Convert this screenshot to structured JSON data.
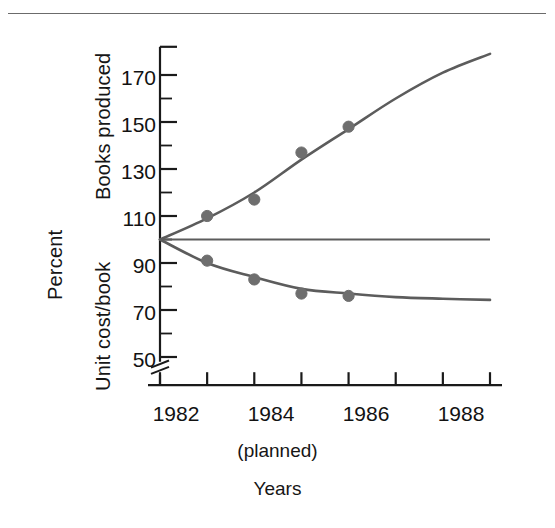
{
  "figure": {
    "top_rule": true,
    "marker_color": "#6e6e6e",
    "curve_color": "#5c5c5c",
    "axis_color": "#1a1a1a",
    "axis_break_note": "y-axis break below 50"
  },
  "axes": {
    "y_outer_label": "Percent",
    "y_inner_label_upper": "Books produced",
    "y_inner_label_lower": "Unit cost/book",
    "x_label": "Years",
    "x_note": "(planned)",
    "y_ticks": [
      "170",
      "150",
      "130",
      "110",
      "90",
      "70",
      "50"
    ],
    "x_ticks": [
      "1982",
      "1984",
      "1986",
      "1988"
    ]
  },
  "chart_data": {
    "type": "line",
    "title": "",
    "xlabel": "Years",
    "ylabel": "Percent",
    "xlim": [
      1982,
      1989
    ],
    "ylim": [
      45,
      182
    ],
    "grid": false,
    "legend": "none",
    "x_tick_values": [
      1982,
      1983,
      1984,
      1985,
      1986,
      1987,
      1988,
      1989
    ],
    "x_tick_labels": [
      "1982",
      "",
      "1984",
      "",
      "1986",
      "",
      "1988",
      ""
    ],
    "y_tick_values": [
      50,
      60,
      70,
      80,
      90,
      100,
      110,
      120,
      130,
      140,
      150,
      160,
      170
    ],
    "y_tick_labels": [
      "50",
      "",
      "70",
      "",
      "90",
      "",
      "110",
      "",
      "130",
      "",
      "150",
      "",
      "170"
    ],
    "annotations": [
      "(planned)"
    ],
    "series": [
      {
        "name": "Books produced",
        "kind": "fitted-curve-with-points",
        "x": [
          1982,
          1983,
          1984,
          1985,
          1986
        ],
        "values": [
          100,
          110,
          117,
          137,
          148
        ],
        "curve_x": [
          1982,
          1983,
          1984,
          1985,
          1986,
          1987,
          1988,
          1989
        ],
        "curve_values": [
          100,
          109,
          120,
          134,
          147,
          160,
          171,
          179
        ]
      },
      {
        "name": "Unit cost/book",
        "kind": "fitted-curve-with-points",
        "x": [
          1982,
          1983,
          1984,
          1985,
          1986
        ],
        "values": [
          100,
          91,
          83,
          77,
          76
        ],
        "curve_x": [
          1982,
          1983,
          1984,
          1985,
          1986,
          1987,
          1988,
          1989
        ],
        "curve_values": [
          100,
          90,
          84,
          79,
          77,
          75.5,
          74.8,
          74.3
        ]
      },
      {
        "name": "Baseline 100%",
        "kind": "reference-line",
        "x": [
          1982,
          1989
        ],
        "values": [
          100,
          100
        ]
      }
    ]
  }
}
